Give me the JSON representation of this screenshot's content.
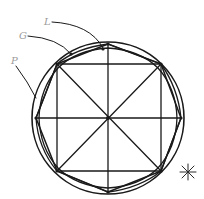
{
  "diagram": {
    "type": "geometric-construction",
    "labels": {
      "L": "L",
      "G": "G",
      "P": "P"
    },
    "marker": "*",
    "colors": {
      "line": "#1a1a1a",
      "label": "#9a9a9a",
      "background": "#ffffff"
    }
  }
}
